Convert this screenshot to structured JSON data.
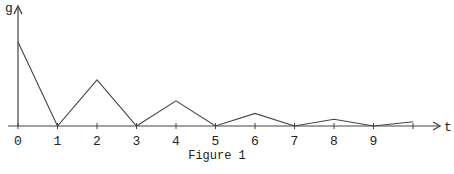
{
  "chart_data": {
    "type": "line",
    "title": "",
    "caption": "Figure 1",
    "xlabel": "t",
    "ylabel": "g",
    "x_ticks": [
      "0",
      "1",
      "2",
      "3",
      "4",
      "5",
      "6",
      "7",
      "8",
      "9"
    ],
    "x": [
      0,
      1,
      2,
      3,
      4,
      5,
      6,
      7,
      8,
      9,
      10
    ],
    "values": [
      1.0,
      0,
      0.55,
      0,
      0.3,
      0,
      0.15,
      0,
      0.08,
      0,
      0.05
    ],
    "xlim": [
      0,
      10.5
    ],
    "ylim": [
      0,
      1.1
    ],
    "grid": false,
    "legend": null
  },
  "layout": {
    "origin_x": 18,
    "origin_y": 126,
    "x_step": 39.5,
    "y_scale": 84,
    "line_color": "#444444"
  }
}
